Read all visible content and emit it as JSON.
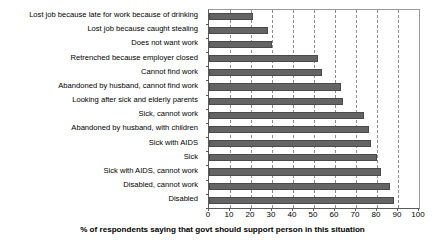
{
  "chart_data": {
    "type": "bar",
    "orientation": "horizontal",
    "title": "",
    "xlabel": "% of respondents saying that govt should support person in this situation",
    "ylabel": "",
    "xlim": [
      0,
      100
    ],
    "xticks": [
      0,
      10,
      20,
      30,
      40,
      50,
      60,
      70,
      80,
      90,
      100
    ],
    "xticklabels": [
      "0",
      "10",
      "20",
      "30",
      "40",
      "50",
      "60",
      "70",
      "80",
      "90",
      "100"
    ],
    "grid": "vertical-dashed",
    "legend": "none",
    "bar_color": "#646464",
    "categories": [
      "Lost job because late for work because of drinking",
      "Lost job because caught stealing",
      "Does not want work",
      "Retrenched because employer closed",
      "Cannot find work",
      "Abandoned by husband, cannot find work",
      "Looking after sick and elderly parents",
      "Sick, cannot work",
      "Abandoned by husband, with children",
      "Sick with AIDS",
      "Sick",
      "Sick with AIDS, cannot work",
      "Disabled, cannot work",
      "Disabled"
    ],
    "values": [
      21,
      28,
      30,
      52,
      54,
      63,
      64,
      74,
      76,
      77,
      80,
      82,
      86,
      88
    ]
  }
}
